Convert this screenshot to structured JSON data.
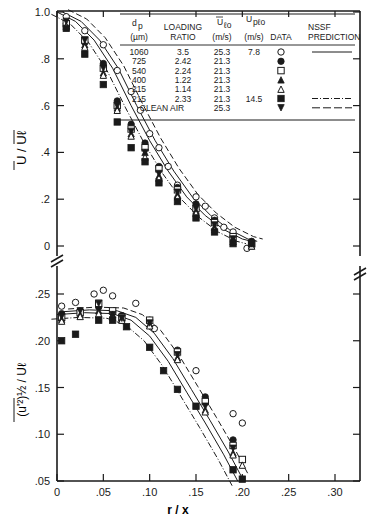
{
  "chart_data": [
    {
      "type": "scatter",
      "panel": "upper",
      "ylabel": "U / U_c (overbar)",
      "xlabel": "r / x",
      "xlim": [
        0,
        0.33
      ],
      "ylim": [
        -0.05,
        1.0
      ],
      "yticks": [
        "1.0",
        ".8",
        ".6",
        ".4",
        ".2",
        "0"
      ],
      "series": [
        {
          "name": "1060 µm",
          "marker": "open-circle",
          "x": [
            0.01,
            0.03,
            0.05,
            0.065,
            0.08,
            0.09,
            0.1,
            0.11,
            0.12,
            0.13,
            0.15,
            0.16,
            0.17,
            0.18,
            0.19,
            0.205
          ],
          "y": [
            0.98,
            0.92,
            0.86,
            0.75,
            0.66,
            0.58,
            0.48,
            0.42,
            0.34,
            0.26,
            0.21,
            0.17,
            0.12,
            0.08,
            0.06,
            -0.01
          ]
        },
        {
          "name": "725 µm",
          "marker": "filled-circle",
          "x": [
            0.01,
            0.03,
            0.05,
            0.065,
            0.08,
            0.095,
            0.11,
            0.13,
            0.15,
            0.17,
            0.19,
            0.21
          ],
          "y": [
            0.95,
            0.87,
            0.78,
            0.62,
            0.52,
            0.44,
            0.34,
            0.25,
            0.18,
            0.11,
            0.04,
            0.02
          ]
        },
        {
          "name": "540 µm",
          "marker": "open-square",
          "x": [
            0.01,
            0.03,
            0.05,
            0.065,
            0.08,
            0.095,
            0.11,
            0.13,
            0.15,
            0.17,
            0.19,
            0.21
          ],
          "y": [
            0.95,
            0.88,
            0.76,
            0.6,
            0.5,
            0.42,
            0.33,
            0.24,
            0.16,
            0.1,
            0.04,
            0.01
          ]
        },
        {
          "name": "400 µm",
          "marker": "filled-triangle",
          "x": [
            0.01,
            0.03,
            0.05,
            0.065,
            0.08,
            0.095,
            0.11,
            0.13,
            0.15,
            0.17,
            0.19,
            0.21
          ],
          "y": [
            0.94,
            0.86,
            0.74,
            0.59,
            0.48,
            0.4,
            0.3,
            0.22,
            0.15,
            0.08,
            0.03,
            0.0
          ]
        },
        {
          "name": "215 µm (LR 1.14)",
          "marker": "open-triangle",
          "x": [
            0.01,
            0.03,
            0.05,
            0.065,
            0.08,
            0.095,
            0.11,
            0.13,
            0.15,
            0.17,
            0.19,
            0.21
          ],
          "y": [
            0.94,
            0.85,
            0.73,
            0.58,
            0.47,
            0.38,
            0.29,
            0.21,
            0.14,
            0.07,
            0.02,
            0.0
          ]
        },
        {
          "name": "215 µm (LR 2.33)",
          "marker": "filled-square",
          "x": [
            0.01,
            0.03,
            0.05,
            0.065,
            0.08,
            0.095,
            0.11,
            0.13,
            0.15,
            0.17,
            0.19,
            0.21
          ],
          "y": [
            0.93,
            0.82,
            0.69,
            0.53,
            0.42,
            0.36,
            0.27,
            0.19,
            0.12,
            0.06,
            0.01,
            0.01
          ]
        },
        {
          "name": "Clean air",
          "marker": "filled-inverted-triangle",
          "x": [
            0.01,
            0.03,
            0.05,
            0.065,
            0.08,
            0.095,
            0.11,
            0.13,
            0.15,
            0.17,
            0.19,
            0.21
          ],
          "y": [
            0.96,
            0.88,
            0.76,
            0.6,
            0.49,
            0.4,
            0.31,
            0.23,
            0.16,
            0.09,
            0.03,
            0.01
          ]
        }
      ]
    },
    {
      "type": "scatter",
      "panel": "lower",
      "ylabel": "(u'^2)^(1/2) / U_c",
      "xlabel": "r / x",
      "xlim": [
        0,
        0.33
      ],
      "ylim": [
        0.05,
        0.25
      ],
      "yticks": [
        ".25",
        ".20",
        ".15",
        ".10",
        ".05"
      ],
      "xticks": [
        "0",
        ".05",
        ".10",
        ".15",
        ".20",
        ".25",
        ".30"
      ],
      "series": [
        {
          "name": "1060 µm",
          "marker": "open-circle",
          "x": [
            0.005,
            0.02,
            0.04,
            0.05,
            0.06,
            0.085,
            0.105,
            0.15,
            0.19,
            0.2
          ],
          "y": [
            0.237,
            0.241,
            0.25,
            0.254,
            0.248,
            0.24,
            0.213,
            0.168,
            0.122,
            0.112
          ]
        },
        {
          "name": "725 µm",
          "marker": "filled-circle",
          "x": [
            0.005,
            0.025,
            0.045,
            0.06,
            0.07,
            0.1,
            0.13,
            0.16,
            0.19
          ],
          "y": [
            0.229,
            0.232,
            0.236,
            0.23,
            0.227,
            0.222,
            0.19,
            0.14,
            0.094
          ]
        },
        {
          "name": "540 µm",
          "marker": "open-square",
          "x": [
            0.005,
            0.025,
            0.045,
            0.06,
            0.07,
            0.1,
            0.13,
            0.16,
            0.19,
            0.2
          ],
          "y": [
            0.225,
            0.23,
            0.24,
            0.232,
            0.225,
            0.222,
            0.188,
            0.135,
            0.088,
            0.073
          ]
        },
        {
          "name": "400 µm",
          "marker": "filled-triangle",
          "x": [
            0.005,
            0.025,
            0.045,
            0.06,
            0.07,
            0.1,
            0.13,
            0.16,
            0.19
          ],
          "y": [
            0.223,
            0.228,
            0.232,
            0.228,
            0.224,
            0.218,
            0.182,
            0.126,
            0.08
          ]
        },
        {
          "name": "215 µm (LR 1.14)",
          "marker": "open-triangle",
          "x": [
            0.005,
            0.025,
            0.045,
            0.06,
            0.07,
            0.1,
            0.13,
            0.16,
            0.19,
            0.2
          ],
          "y": [
            0.221,
            0.226,
            0.229,
            0.225,
            0.222,
            0.216,
            0.18,
            0.124,
            0.078,
            0.067
          ]
        },
        {
          "name": "215 µm (LR 2.33)",
          "marker": "filled-square",
          "x": [
            0.005,
            0.02,
            0.045,
            0.06,
            0.075,
            0.1,
            0.115,
            0.13,
            0.15,
            0.19,
            0.2
          ],
          "y": [
            0.2,
            0.207,
            0.222,
            0.222,
            0.215,
            0.193,
            0.168,
            0.148,
            0.13,
            0.062,
            0.052
          ]
        },
        {
          "name": "Clean air",
          "marker": "filled-inverted-triangle",
          "x": [
            0.005,
            0.025,
            0.045,
            0.06,
            0.07,
            0.1,
            0.13,
            0.16,
            0.19
          ],
          "y": [
            0.226,
            0.232,
            0.24,
            0.228,
            0.224,
            0.219,
            0.185,
            0.13,
            0.085
          ]
        }
      ]
    }
  ],
  "legend": {
    "headers": {
      "dp": "d",
      "dp_sub": "p",
      "dp_unit": "(µm)",
      "loading1": "LOADING",
      "loading2": "RATIO",
      "uc": "U",
      "uc_sub": "ℓo",
      "uc_unit": "(m/s)",
      "up": "U",
      "up_sub": "pℓo",
      "up_unit": "(m/s)",
      "data": "DATA",
      "nssf1": "NSSF",
      "nssf2": "PREDICTION"
    },
    "rows": [
      {
        "dp": "1060",
        "ratio": "3.5",
        "uc": "25.3",
        "up": "7.8",
        "marker": "○",
        "line": "solid"
      },
      {
        "dp": "725",
        "ratio": "2.42",
        "uc": "21.3",
        "up": "",
        "marker": "●",
        "line": ""
      },
      {
        "dp": "540",
        "ratio": "2.24",
        "uc": "21.3",
        "up": "",
        "marker": "□",
        "line": ""
      },
      {
        "dp": "400",
        "ratio": "1.22",
        "uc": "21.3",
        "up": "",
        "marker": "▲",
        "line": ""
      },
      {
        "dp": "215",
        "ratio": "1.14",
        "uc": "21.3",
        "up": "",
        "marker": "△",
        "line": ""
      },
      {
        "dp": "215",
        "ratio": "2.33",
        "uc": "21.3",
        "up": "14.5",
        "marker": "■",
        "line": "dash-dot"
      },
      {
        "dp": "CLEAN AIR",
        "ratio": "",
        "uc": "25.3",
        "up": "",
        "marker": "▼",
        "line": "dashed"
      }
    ]
  },
  "axes": {
    "upper_yticks": [
      "1.0",
      ".8",
      ".6",
      ".4",
      ".2",
      "0"
    ],
    "lower_yticks": [
      ".25",
      ".20",
      ".15",
      ".10",
      ".05"
    ],
    "xticks": [
      "0",
      ".05",
      ".10",
      ".15",
      ".20",
      ".25",
      ".30"
    ],
    "xlabel": "r / x",
    "upper_ylabel": "U / U",
    "upper_ylabel_sub": "ℓ",
    "lower_ylabel": "(u'²)½ / U",
    "lower_ylabel_sub": "ℓ"
  }
}
